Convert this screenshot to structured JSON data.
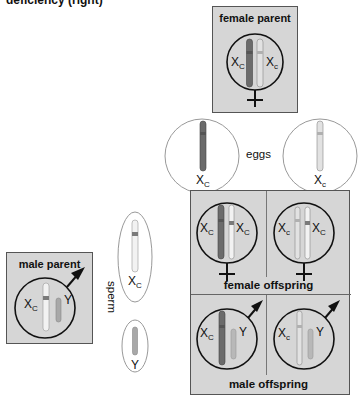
{
  "title_fragment": "deficiency (right)",
  "female_parent": {
    "label": "female parent",
    "chromosomes": [
      {
        "base": "X",
        "sub": "C",
        "shade": "dark"
      },
      {
        "base": "X",
        "sub": "c",
        "shade": "light"
      }
    ],
    "symbol": "female-symbol"
  },
  "eggs": {
    "label": "eggs",
    "items": [
      {
        "base": "X",
        "sub": "C",
        "shade": "dark"
      },
      {
        "base": "X",
        "sub": "c",
        "shade": "light"
      }
    ]
  },
  "male_parent": {
    "label": "male parent",
    "chromosomes": [
      {
        "base": "X",
        "sub": "C",
        "shade": "white-banded"
      },
      {
        "base": "Y",
        "sub": "",
        "shade": "gray"
      }
    ],
    "symbol": "male-symbol"
  },
  "sperm": {
    "label": "sperm",
    "items": [
      {
        "base": "X",
        "sub": "C",
        "shade": "white-banded"
      },
      {
        "base": "Y",
        "sub": "",
        "shade": "gray"
      }
    ]
  },
  "punnett": {
    "female_offspring_label": "female offspring",
    "male_offspring_label": "male offspring",
    "cells": [
      {
        "row": "female",
        "col": 0,
        "left": {
          "base": "X",
          "sub": "C"
        },
        "right": {
          "base": "X",
          "sub": "C"
        }
      },
      {
        "row": "female",
        "col": 1,
        "left": {
          "base": "X",
          "sub": "c"
        },
        "right": {
          "base": "X",
          "sub": "C"
        }
      },
      {
        "row": "male",
        "col": 0,
        "left": {
          "base": "X",
          "sub": "C"
        },
        "right": {
          "base": "Y",
          "sub": ""
        }
      },
      {
        "row": "male",
        "col": 1,
        "left": {
          "base": "X",
          "sub": "c"
        },
        "right": {
          "base": "Y",
          "sub": ""
        }
      }
    ]
  },
  "colors": {
    "box_fill": "#d6d6d6",
    "dark_chromosome": "#6b6b6b",
    "light_chromosome": "#e2e2e2",
    "band": "#7a7a7a",
    "outline": "#222222"
  }
}
